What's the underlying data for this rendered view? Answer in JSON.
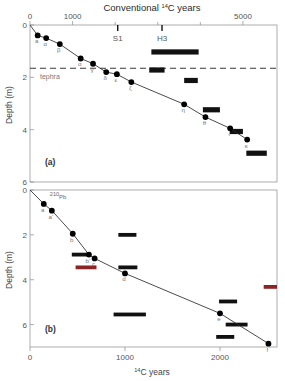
{
  "figure": {
    "top_axis_title": "Conventional ¹⁴C years",
    "bottom_axis_title": "¹⁴C years",
    "y_axis_title": "Depth (m)",
    "panel_a_label": "(a)",
    "panel_b_label": "(b)",
    "tephra_label": "tephra",
    "pb_label": "²¹⁰Pb",
    "tephra_markers": [
      "S1",
      "H3"
    ],
    "colors": {
      "point": "#000000",
      "bar": "#111111",
      "red_bar": "#8B2525",
      "axis": "#8a8a8a",
      "curve": "#2a2a2a"
    }
  },
  "chart_data": [
    {
      "type": "scatter",
      "panel": "(a)",
      "title": "Conventional ¹⁴C years",
      "xlabel": "Conventional ¹⁴C years",
      "ylabel": "Depth (m)",
      "xlim": [
        0,
        5800
      ],
      "ylim": [
        0,
        6
      ],
      "y_inverted": true,
      "x_ticks_labeled": [
        0,
        1000,
        5000
      ],
      "x_ticks_minor": [
        2000,
        3000,
        4000
      ],
      "y_ticks": [
        0,
        2,
        4,
        6
      ],
      "grid": false,
      "legend": "none",
      "tephra_line_depth": 1.65,
      "tephra_markers": [
        {
          "name": "S1",
          "x": 2060
        },
        {
          "name": "H3",
          "x": 3100
        }
      ],
      "points": [
        {
          "label": "",
          "x": 0,
          "y": 0.0
        },
        {
          "label": "a",
          "x": 180,
          "y": 0.4
        },
        {
          "label": "α",
          "x": 380,
          "y": 0.5
        },
        {
          "label": "β",
          "x": 700,
          "y": 0.73
        },
        {
          "label": "α",
          "x": 1190,
          "y": 1.28
        },
        {
          "label": "γ",
          "x": 1480,
          "y": 1.48
        },
        {
          "label": "δ",
          "x": 1790,
          "y": 1.8
        },
        {
          "label": "ε",
          "x": 2040,
          "y": 1.88
        },
        {
          "label": "ζ",
          "x": 2380,
          "y": 2.18
        },
        {
          "label": "η",
          "x": 3620,
          "y": 3.03
        },
        {
          "label": "θ",
          "x": 4120,
          "y": 3.52
        },
        {
          "label": "ι",
          "x": 4700,
          "y": 3.95
        },
        {
          "label": "κ",
          "x": 5100,
          "y": 4.38
        }
      ],
      "black_bars": [
        {
          "x_start": 2850,
          "x_end": 3960,
          "y": 1.03
        },
        {
          "x_start": 2800,
          "x_end": 3160,
          "y": 1.72
        },
        {
          "x_start": 3620,
          "x_end": 3940,
          "y": 2.12
        },
        {
          "x_start": 4060,
          "x_end": 4460,
          "y": 3.24
        },
        {
          "x_start": 4690,
          "x_end": 5000,
          "y": 4.07
        },
        {
          "x_start": 5080,
          "x_end": 5560,
          "y": 4.9
        }
      ]
    },
    {
      "type": "scatter",
      "panel": "(b)",
      "xlabel": "¹⁴C years",
      "ylabel": "Depth (m)",
      "xlim": [
        0,
        2600
      ],
      "ylim": [
        0,
        7
      ],
      "y_inverted": true,
      "x_ticks": [
        0,
        1000,
        2000
      ],
      "y_ticks": [
        0,
        2,
        4,
        6
      ],
      "grid": false,
      "legend": "none",
      "points": [
        {
          "label": "",
          "x": 0,
          "y": 0.0
        },
        {
          "label": "a",
          "x": 145,
          "y": 0.62
        },
        {
          "label": "a'",
          "x": 230,
          "y": 0.92
        },
        {
          "label": "b",
          "x": 450,
          "y": 1.95
        },
        {
          "label": "b'",
          "x": 620,
          "y": 2.88
        },
        {
          "label": "c",
          "x": 680,
          "y": 3.05
        },
        {
          "label": "d",
          "x": 1000,
          "y": 3.72
        },
        {
          "label": "e",
          "x": 2000,
          "y": 5.5
        },
        {
          "label": "f",
          "x": 2510,
          "y": 6.85
        }
      ],
      "black_bars": [
        {
          "x_start": 930,
          "x_end": 1120,
          "y": 2.0
        },
        {
          "x_start": 440,
          "x_end": 640,
          "y": 2.88
        },
        {
          "x_start": 930,
          "x_end": 1130,
          "y": 3.45
        },
        {
          "x_start": 880,
          "x_end": 1220,
          "y": 5.55
        },
        {
          "x_start": 1990,
          "x_end": 2180,
          "y": 4.97
        },
        {
          "x_start": 2060,
          "x_end": 2290,
          "y": 6.0
        },
        {
          "x_start": 1960,
          "x_end": 2150,
          "y": 6.55
        }
      ],
      "red_bars": [
        {
          "x_start": 480,
          "x_end": 700,
          "y": 3.45
        },
        {
          "x_start": 2460,
          "x_end": 2600,
          "y": 4.32
        }
      ]
    }
  ]
}
